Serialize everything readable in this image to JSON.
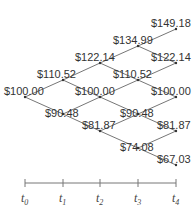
{
  "diagram": {
    "type": "binomial-tree",
    "steps": 4,
    "nodes": [
      {
        "id": "n00",
        "step": 0,
        "x": 25,
        "y": 97,
        "label": "$100.00"
      },
      {
        "id": "n10",
        "step": 1,
        "x": 63,
        "y": 80,
        "label": "$110.52"
      },
      {
        "id": "n11",
        "step": 1,
        "x": 63,
        "y": 114,
        "label": "$90.48"
      },
      {
        "id": "n20",
        "step": 2,
        "x": 100,
        "y": 63,
        "label": "$122.14"
      },
      {
        "id": "n21",
        "step": 2,
        "x": 100,
        "y": 97,
        "label": "$100.00"
      },
      {
        "id": "n22",
        "step": 2,
        "x": 100,
        "y": 131,
        "label": "$81.87"
      },
      {
        "id": "n30",
        "step": 3,
        "x": 138,
        "y": 46,
        "label": "$134.99"
      },
      {
        "id": "n31",
        "step": 3,
        "x": 138,
        "y": 80,
        "label": "$110.52"
      },
      {
        "id": "n32",
        "step": 3,
        "x": 138,
        "y": 114,
        "label": "$90.48"
      },
      {
        "id": "n33",
        "step": 3,
        "x": 138,
        "y": 148,
        "label": "$74.08"
      },
      {
        "id": "n40",
        "step": 4,
        "x": 176,
        "y": 29,
        "label": "$149.18"
      },
      {
        "id": "n41",
        "step": 4,
        "x": 176,
        "y": 63,
        "label": "$122.14"
      },
      {
        "id": "n42",
        "step": 4,
        "x": 176,
        "y": 97,
        "label": "$100.00"
      },
      {
        "id": "n43",
        "step": 4,
        "x": 176,
        "y": 131,
        "label": "$81.87"
      },
      {
        "id": "n44",
        "step": 4,
        "x": 176,
        "y": 165,
        "label": "$67.03"
      }
    ],
    "labels": [
      {
        "text": "$100.00",
        "x": 4,
        "y": 95
      },
      {
        "text": "$110.52",
        "x": 37,
        "y": 78
      },
      {
        "text": "$90.48",
        "x": 45,
        "y": 117
      },
      {
        "text": "$122.14",
        "x": 75,
        "y": 61
      },
      {
        "text": "$100.00",
        "x": 75,
        "y": 95
      },
      {
        "text": "$81.87",
        "x": 82,
        "y": 129
      },
      {
        "text": "$134.99",
        "x": 113,
        "y": 44
      },
      {
        "text": "$110.52",
        "x": 113,
        "y": 78
      },
      {
        "text": "$90.48",
        "x": 120,
        "y": 117
      },
      {
        "text": "$74.08",
        "x": 120,
        "y": 151
      },
      {
        "text": "$149.18",
        "x": 151,
        "y": 27
      },
      {
        "text": "$122.14",
        "x": 151,
        "y": 61
      },
      {
        "text": "$100.00",
        "x": 151,
        "y": 95
      },
      {
        "text": "$81.87",
        "x": 157,
        "y": 129
      },
      {
        "text": "$67.03",
        "x": 157,
        "y": 163
      }
    ],
    "axis": {
      "y": 183,
      "ticks": [
        {
          "x": 25,
          "label": "t",
          "sub": "0"
        },
        {
          "x": 63,
          "label": "t",
          "sub": "1"
        },
        {
          "x": 100,
          "label": "t",
          "sub": "2"
        },
        {
          "x": 138,
          "label": "t",
          "sub": "3"
        },
        {
          "x": 176,
          "label": "t",
          "sub": "4"
        }
      ]
    }
  }
}
